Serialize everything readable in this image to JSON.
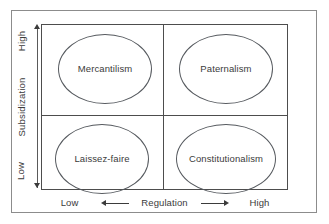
{
  "chart_data": {
    "type": "table",
    "title": "",
    "xlabel": "Regulation",
    "ylabel": "Subsidization",
    "x_axis": {
      "label": "Regulation",
      "low_label": "Low",
      "high_label": "High",
      "direction_low_icon": "arrow-left-icon",
      "direction_high_icon": "arrow-right-icon"
    },
    "y_axis": {
      "label": "Subsidization",
      "low_label": "Low",
      "high_label": "High",
      "direction_high_icon": "arrow-up-icon",
      "direction_low_icon": "arrow-down-icon"
    },
    "categories": [
      "Low Regulation",
      "High Regulation"
    ],
    "rows": [
      "High Subsidization",
      "Low Subsidization"
    ],
    "cells": [
      {
        "row": "High Subsidization",
        "column": "Low Regulation",
        "label": "Mercantilism"
      },
      {
        "row": "High Subsidization",
        "column": "High Regulation",
        "label": "Paternalism"
      },
      {
        "row": "Low Subsidization",
        "column": "Low Regulation",
        "label": "Laissez-faire"
      },
      {
        "row": "Low Subsidization",
        "column": "High Regulation",
        "label": "Constitutionalism"
      }
    ],
    "grid": true,
    "legend": "none"
  },
  "quadrants": {
    "top_left": "Mercantilism",
    "top_right": "Paternalism",
    "bottom_left": "Laissez-faire",
    "bottom_right": "Constitutionalism"
  },
  "axes": {
    "vertical": {
      "high": "High",
      "title": "Subsidization",
      "low": "Low"
    },
    "horizontal": {
      "low": "Low",
      "title": "Regulation",
      "high": "High"
    }
  },
  "colors": {
    "outer_border": "#8c8c8c",
    "matrix_border": "#4d4d4d",
    "ellipse_border": "#55595e",
    "text": "#3b3b3b",
    "background": "#ffffff"
  }
}
